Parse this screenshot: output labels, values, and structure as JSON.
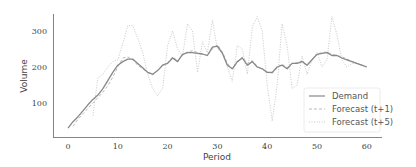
{
  "chart_data": {
    "type": "line",
    "title": "",
    "xlabel": "Period",
    "ylabel": "Volume",
    "xlim": [
      -3,
      62
    ],
    "ylim": [
      10,
      355
    ],
    "xticks": [
      0,
      10,
      20,
      30,
      40,
      50,
      60
    ],
    "yticks": [
      100,
      200,
      300
    ],
    "grid": false,
    "legend_position": "lower right",
    "legend": [
      "Demand",
      "Forecast (t+1)",
      "Forecast (t+5)"
    ],
    "series": [
      {
        "name": "Demand",
        "style": "solid",
        "color": "#888888",
        "x": [
          0,
          1,
          2,
          3,
          4,
          5,
          6,
          7,
          8,
          9,
          10,
          11,
          12,
          13,
          14,
          15,
          16,
          17,
          18,
          19,
          20,
          21,
          22,
          23,
          24,
          25,
          26,
          27,
          28,
          29,
          30,
          31,
          32,
          33,
          34,
          35,
          36,
          37,
          38,
          39,
          40,
          41,
          42,
          43,
          44,
          45,
          46,
          47,
          48,
          49,
          50,
          51,
          52,
          53,
          54,
          55,
          56,
          57,
          58,
          59,
          60
        ],
        "values": [
          30,
          48,
          62,
          78,
          95,
          110,
          122,
          140,
          162,
          185,
          205,
          215,
          222,
          222,
          210,
          198,
          185,
          180,
          190,
          205,
          210,
          225,
          215,
          235,
          240,
          240,
          238,
          236,
          232,
          255,
          258,
          238,
          205,
          195,
          215,
          225,
          205,
          215,
          200,
          195,
          185,
          185,
          200,
          205,
          195,
          210,
          210,
          215,
          205,
          220,
          235,
          238,
          240,
          232,
          232,
          225,
          220,
          215,
          210,
          205,
          200
        ]
      },
      {
        "name": "Forecast (t+1)",
        "style": "dashed",
        "color": "#bbbbbb",
        "x": [
          1,
          2,
          3,
          4,
          5,
          6,
          7,
          8,
          9,
          10,
          11,
          12,
          13,
          14,
          15,
          16,
          17,
          18,
          19,
          20,
          21,
          22,
          23,
          24,
          25,
          26,
          27,
          28,
          29,
          30,
          31,
          32,
          33,
          34,
          35,
          36,
          37,
          38,
          39,
          40,
          41,
          42,
          43,
          44,
          45,
          46,
          47,
          48,
          49,
          50,
          51,
          52,
          53,
          54,
          55,
          56,
          57,
          58,
          59,
          60
        ],
        "values": [
          35,
          55,
          70,
          85,
          100,
          115,
          130,
          148,
          172,
          200,
          225,
          228,
          220,
          205,
          195,
          185,
          178,
          190,
          205,
          212,
          228,
          218,
          232,
          242,
          245,
          240,
          236,
          232,
          250,
          262,
          242,
          210,
          195,
          212,
          228,
          210,
          218,
          202,
          195,
          185,
          182,
          198,
          208,
          198,
          210,
          212,
          216,
          206,
          220,
          236,
          240,
          242,
          235,
          232,
          228,
          222,
          216,
          210,
          205,
          200
        ]
      },
      {
        "name": "Forecast (t+5)",
        "style": "dotted",
        "color": "#c8c8c8",
        "x": [
          5,
          6,
          7,
          8,
          9,
          10,
          11,
          12,
          13,
          14,
          15,
          16,
          17,
          18,
          19,
          20,
          21,
          22,
          23,
          24,
          25,
          26,
          27,
          28,
          29,
          30,
          31,
          32,
          33,
          34,
          35,
          36,
          37,
          38,
          39,
          40,
          41,
          42,
          43,
          44,
          45,
          46,
          47,
          48,
          49,
          50,
          51,
          52,
          53,
          54,
          55,
          56,
          57,
          58,
          59,
          60
        ],
        "values": [
          65,
          170,
          180,
          200,
          215,
          220,
          265,
          315,
          315,
          280,
          240,
          180,
          140,
          120,
          140,
          260,
          300,
          250,
          230,
          320,
          300,
          185,
          270,
          240,
          330,
          250,
          240,
          200,
          160,
          260,
          250,
          180,
          310,
          340,
          300,
          150,
          50,
          150,
          320,
          260,
          140,
          150,
          230,
          180,
          220,
          240,
          200,
          220,
          340,
          290,
          220,
          200,
          210,
          210,
          205,
          200
        ]
      }
    ]
  }
}
